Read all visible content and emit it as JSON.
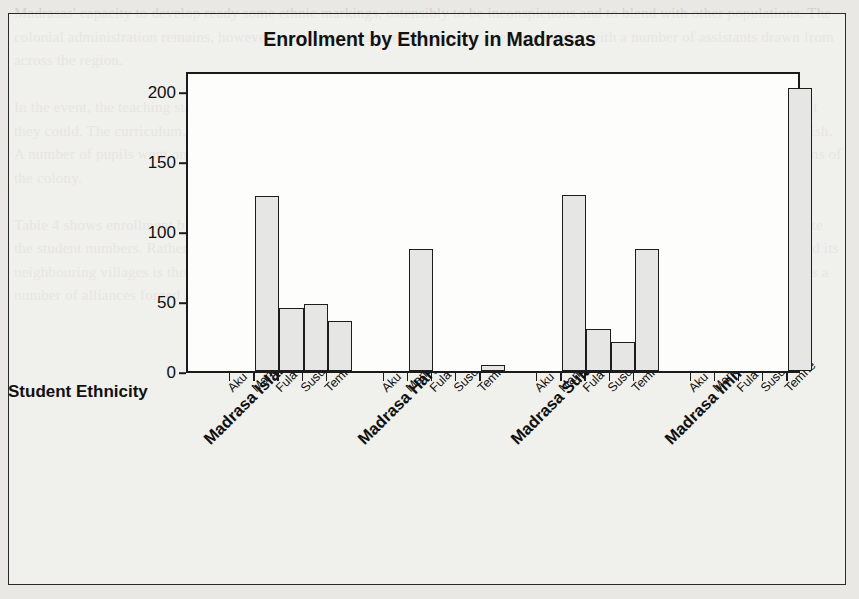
{
  "figure": {
    "background_color": "#e9e8e4",
    "plot_background_color": "#fdfdfc",
    "bar_fill_color": "#e6e6e4",
    "bar_edge_color": "#1d1d1d"
  },
  "page_bleed_text": "Madrasas' capacity to develop ready some ethnic markings, ostensibly to be inconspicuous and to blend with other populations. The colonial administration remains, however, a constant presence with its own attendant clerks, with a number of assistants drawn from across the region.\n\nIn the event, the teaching staff of madrasas had to make a living elsewhere, and the families of children enrolled contributed what they could. The curriculum, which was largely religious, was gradually supplemented with elementary arithmetic and basic English. A number of pupils went on to other schools, and some of the graduates found employment in the civil service and in trading firms of the colony.\n\nTable 4 shows enrollment by ethnicity across the four madrasas surveyed. Aku students, despite the urban setting, do not dominate the student numbers. Rather, the notable concentration of Mandingo in the Fula- and Susu-speaking districts around Freetown and its neighbouring villages is the figure for Temne in Madrasa Immaniyia, and a far more extensive net of other communities, suggests a number of alliances forged at the time of the founding of the madrasas.",
  "chart_data": {
    "type": "bar",
    "title": "Enrollment by Ethnicity in Madrasas",
    "xlabel": "Student Ethnicity",
    "ylabel": "Student Enrollment",
    "ylim": [
      0,
      215
    ],
    "yticks": [
      0,
      50,
      100,
      150,
      200
    ],
    "ytick_labels": [
      "0",
      "50",
      "100",
      "150",
      "200"
    ],
    "grid": false,
    "legend": "none",
    "categories": [
      "Aku",
      "Mandingo",
      "Fula",
      "Susu",
      "Temne"
    ],
    "groups": [
      "Madrasa Islamia",
      "Madrasa Harunia",
      "Madrasa Sulaimania",
      "Madrasa Immaniyia"
    ],
    "series": [
      {
        "name": "Madrasa Islamia",
        "values": [
          0,
          125,
          45,
          48,
          36
        ]
      },
      {
        "name": "Madrasa Harunia",
        "values": [
          0,
          87,
          0,
          0,
          4
        ]
      },
      {
        "name": "Madrasa Sulaimania",
        "values": [
          0,
          126,
          30,
          21,
          12
        ]
      },
      {
        "name": "Madrasa Immaniyia",
        "values": [
          0,
          0,
          0,
          0,
          202
        ]
      }
    ],
    "extra_bars": [
      {
        "group": "Madrasa Sulaimania",
        "category": "Temne",
        "value": 87,
        "note": "tall bar at right of group 3"
      }
    ]
  }
}
